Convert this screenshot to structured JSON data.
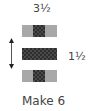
{
  "diagram": {
    "top_label": "3½",
    "side_label": "1½",
    "caption": "Make 6",
    "colors": {
      "light_fabric": "#a8a8a8",
      "dark_fabric": "#2e2e2e",
      "text": "#444444"
    },
    "strips": [
      {
        "name": "top-strip",
        "segments": [
          "light",
          "dark",
          "light"
        ]
      },
      {
        "name": "middle-strip",
        "segments": [
          "dark"
        ]
      },
      {
        "name": "bottom-strip",
        "segments": [
          "light",
          "dark",
          "light"
        ]
      }
    ],
    "arrow": "double-vertical-arrow"
  }
}
